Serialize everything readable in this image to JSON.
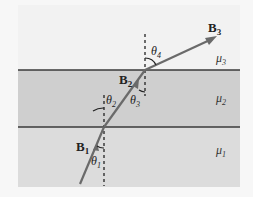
{
  "diagram": {
    "labels": {
      "b1": "B",
      "b1_sub": "1",
      "b2": "B",
      "b2_sub": "2",
      "b3": "B",
      "b3_sub": "3",
      "theta1": "θ",
      "theta1_sub": "1",
      "theta2": "θ",
      "theta2_sub": "2",
      "theta3": "θ",
      "theta3_sub": "3",
      "theta4": "θ",
      "theta4_sub": "4",
      "mu1": "μ",
      "mu1_sub": "1",
      "mu2": "μ",
      "mu2_sub": "2",
      "mu3": "μ",
      "mu3_sub": "3"
    },
    "colors": {
      "background": "#f7f7f7",
      "region_top": "#f2f2f2",
      "region_middle": "#cfcfcf",
      "region_bottom": "#dcdcdc",
      "boundary": "#3a3a3a",
      "ray": "#6a6a6a"
    }
  }
}
